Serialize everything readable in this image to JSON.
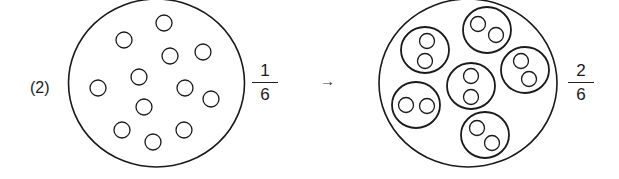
{
  "problem": {
    "label": "(2)",
    "left": {
      "fraction": {
        "numerator": "1",
        "denominator": "6"
      },
      "small_circle_count": 12
    },
    "arrow": "→",
    "right": {
      "fraction": {
        "numerator": "2",
        "denominator": "6"
      },
      "group_count": 6,
      "circles_per_group": 2
    }
  },
  "colors": {
    "stroke": "#1a1a1a",
    "background": "#ffffff"
  }
}
